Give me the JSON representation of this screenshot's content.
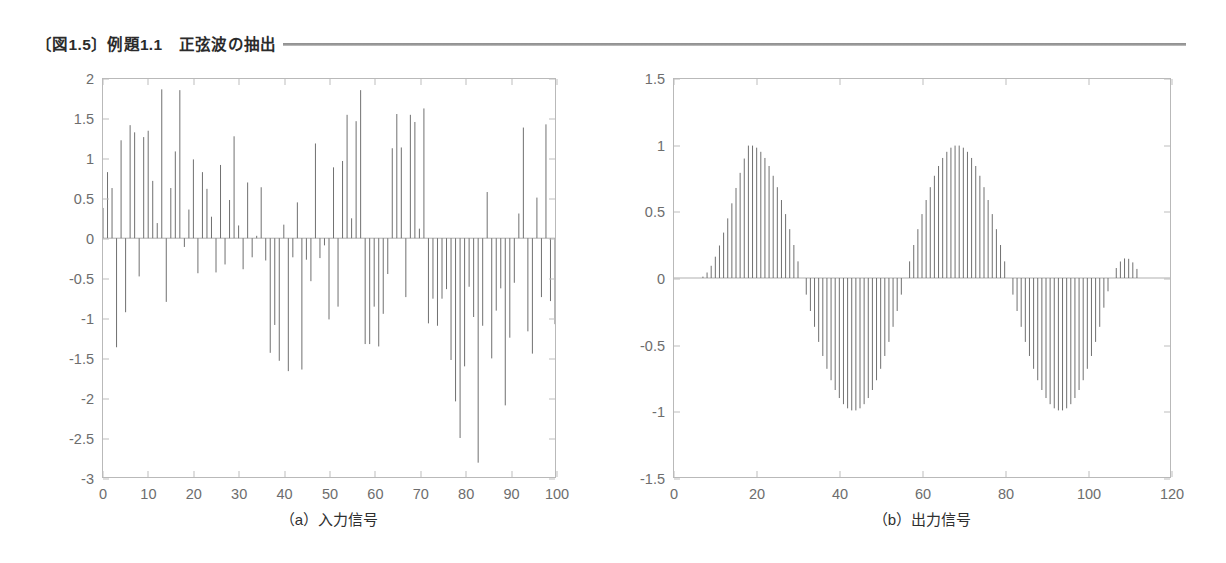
{
  "header": {
    "title": "〔図1.5〕例題1.1　正弦波の抽出",
    "rule_color": "#8f8f8f"
  },
  "panels": {
    "a": {
      "caption": "（a）入力信号"
    },
    "b": {
      "caption": "（b）出力信号"
    }
  },
  "chart_data": [
    {
      "id": "input-signal",
      "type": "bar",
      "title": "（a）入力信号",
      "xlabel": "",
      "ylabel": "",
      "xlim": [
        0,
        100
      ],
      "ylim": [
        -3,
        2
      ],
      "xticks": [
        0,
        10,
        20,
        30,
        40,
        50,
        60,
        70,
        80,
        90,
        100
      ],
      "xticklabels": [
        "0",
        "10",
        "20",
        "30",
        "40",
        "50",
        "60",
        "70",
        "80",
        "90",
        "100"
      ],
      "yticks": [
        2,
        1.5,
        1,
        0.5,
        0,
        -0.5,
        -1,
        -1.5,
        -2,
        -2.5,
        -3
      ],
      "yticklabels": [
        "2",
        "1.5",
        "1",
        "0.5",
        "0",
        "-0.5",
        "-1",
        "-1.5",
        "-2",
        "-2.5",
        "-3"
      ],
      "grid": false,
      "legend": false,
      "stem_color": "#6f6f6f",
      "x": [
        0,
        1,
        2,
        3,
        4,
        5,
        6,
        7,
        8,
        9,
        10,
        11,
        12,
        13,
        14,
        15,
        16,
        17,
        18,
        19,
        20,
        21,
        22,
        23,
        24,
        25,
        26,
        27,
        28,
        29,
        30,
        31,
        32,
        33,
        34,
        35,
        36,
        37,
        38,
        39,
        40,
        41,
        42,
        43,
        44,
        45,
        46,
        47,
        48,
        49,
        50,
        51,
        52,
        53,
        54,
        55,
        56,
        57,
        58,
        59,
        60,
        61,
        62,
        63,
        64,
        65,
        66,
        67,
        68,
        69,
        70,
        71,
        72,
        73,
        74,
        75,
        76,
        77,
        78,
        79,
        80,
        81,
        82,
        83,
        84,
        85,
        86,
        87,
        88,
        89,
        90,
        91,
        92,
        93,
        94,
        95,
        96,
        97,
        98,
        99,
        100
      ],
      "values": [
        0.38,
        0.83,
        0.63,
        -1.37,
        1.23,
        -0.93,
        1.42,
        1.33,
        -0.48,
        1.27,
        1.35,
        0.72,
        0.19,
        1.87,
        -0.8,
        0.63,
        1.09,
        1.86,
        -0.11,
        0.36,
        0.99,
        -0.44,
        0.83,
        0.62,
        0.27,
        -0.43,
        0.92,
        -0.33,
        0.48,
        1.28,
        0.16,
        -0.39,
        0.7,
        -0.24,
        0.03,
        0.64,
        -0.28,
        -1.44,
        -1.09,
        -1.54,
        0.17,
        -1.67,
        -0.24,
        0.45,
        -1.65,
        -0.27,
        -0.54,
        1.19,
        -0.25,
        -0.09,
        -1.02,
        0.89,
        -0.86,
        0.97,
        1.55,
        0.25,
        1.47,
        1.86,
        -1.33,
        -1.33,
        -0.86,
        -1.36,
        -0.95,
        -0.45,
        1.13,
        1.56,
        1.14,
        -0.74,
        1.55,
        1.46,
        0.12,
        1.63,
        -1.07,
        -0.76,
        -1.1,
        -0.76,
        -0.64,
        -1.53,
        -2.05,
        -2.51,
        -1.61,
        -0.61,
        -0.99,
        -2.82,
        -1.1,
        0.58,
        -1.51,
        -0.91,
        -0.63,
        -2.1,
        -1.25,
        -0.56,
        0.31,
        1.39,
        -1.17,
        -1.45,
        0.51,
        -0.74,
        1.43,
        -0.79,
        -1.08
      ]
    },
    {
      "id": "output-signal",
      "type": "bar",
      "title": "（b）出力信号",
      "xlabel": "",
      "ylabel": "",
      "xlim": [
        0,
        120
      ],
      "ylim": [
        -1.5,
        1.5
      ],
      "xticks": [
        0,
        20,
        40,
        60,
        80,
        100,
        120
      ],
      "xticklabels": [
        "0",
        "20",
        "40",
        "60",
        "80",
        "100",
        "120"
      ],
      "yticks": [
        1.5,
        1,
        0.5,
        0,
        -0.5,
        -1,
        -1.5
      ],
      "yticklabels": [
        "1.5",
        "1",
        "0.5",
        "0",
        "-0.5",
        "-1",
        "-1.5"
      ],
      "grid": false,
      "legend": false,
      "stem_color": "#6f6f6f",
      "description": "抽出された正弦波。n=6付近から立ち上がり、n=113付近で減衰して終わる。周期はおよそ50サンプル、振幅は約1.0。",
      "sine": {
        "start": 6,
        "end": 113,
        "period": 50,
        "amplitude": 1.0,
        "phase_offset": 6,
        "ramp_in": 12,
        "ramp_out": 10
      }
    }
  ]
}
